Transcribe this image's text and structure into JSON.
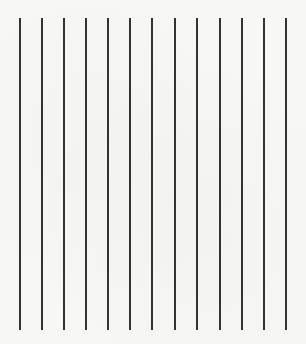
{
  "figure": {
    "line_count": 13,
    "line_color": "#333333",
    "background_color": "#f7f7f5",
    "line_top_y": 18,
    "line_bottom_y": 330,
    "lines_x": [
      20,
      42,
      64,
      86,
      108,
      130,
      152,
      175,
      197,
      220,
      242,
      264,
      286
    ]
  }
}
